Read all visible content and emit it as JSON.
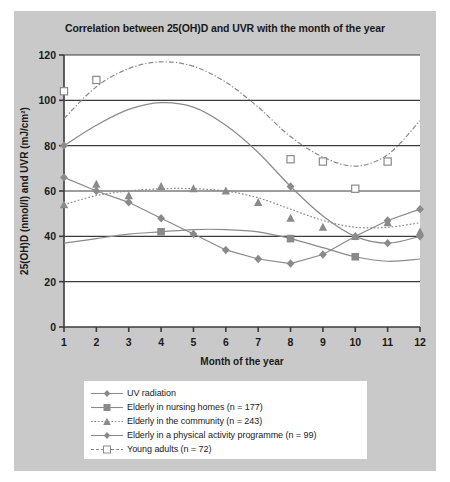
{
  "figure": {
    "title": "Correlation between 25(OH)D and UVR with the month of the year",
    "panel_color": "#c9c9c9",
    "plot_background": "#ffffff",
    "line_color": "#6e6e6e",
    "axis_color": "#3c3c3c"
  },
  "chart_data": {
    "type": "line",
    "title": "Correlation between 25(OH)D and UVR with the month of the year",
    "xlabel": "Month of the year",
    "ylabel": "25(OH)D (nmol/l) and UVR (mJ/cm²)",
    "x": [
      1,
      2,
      3,
      4,
      5,
      6,
      7,
      8,
      9,
      10,
      11,
      12
    ],
    "xticklabels": [
      "1",
      "2",
      "3",
      "4",
      "5",
      "6",
      "7",
      "8",
      "9",
      "10",
      "11",
      "12"
    ],
    "xlim": [
      1,
      12
    ],
    "ylim": [
      0,
      120
    ],
    "yticks": [
      0,
      20,
      40,
      60,
      80,
      100,
      120
    ],
    "yticklabels": [
      "0",
      "20",
      "40",
      "60",
      "80",
      "100",
      "120"
    ],
    "grid": "horizontal-gridlines-at-yticks",
    "legend_position": "below-plot",
    "series": [
      {
        "name": "UV radiation",
        "marker": "filled-diamond",
        "linestyle": "solid-smooth",
        "color": "#8a8a8a",
        "values": [
          80,
          89,
          96,
          99,
          97,
          89,
          77,
          62,
          49,
          40,
          37,
          40
        ],
        "markers_at": [
          1,
          8,
          11,
          12
        ],
        "marker_values": [
          80,
          62,
          37,
          40
        ]
      },
      {
        "name": "Elderly in nursing homes (n = 177)",
        "marker": "filled-square",
        "linestyle": "solid-smooth",
        "color": "#8a8a8a",
        "values": [
          37,
          39,
          41,
          42,
          43,
          43,
          42,
          39,
          35,
          31,
          29,
          30
        ],
        "markers_at": [
          4,
          8,
          10
        ],
        "marker_values": [
          42,
          39,
          31
        ]
      },
      {
        "name": "Elderly in the community (n = 243)",
        "marker": "filled-triangle",
        "linestyle": "dotted",
        "color": "#8a8a8a",
        "values": [
          54,
          58,
          60,
          61,
          61,
          60,
          57,
          52,
          47,
          44,
          44,
          46
        ],
        "markers_at": [
          1,
          2,
          3,
          4,
          5,
          6,
          7,
          8,
          9,
          10,
          11,
          12
        ],
        "marker_values": [
          54,
          63,
          58,
          62,
          61,
          60,
          55,
          48,
          44,
          40,
          46,
          42
        ]
      },
      {
        "name": "Elderly in a physical activity programme (n = 99)",
        "marker": "filled-diamond",
        "linestyle": "solid-straight",
        "color": "#8a8a8a",
        "values": [
          66,
          60,
          55,
          48,
          41,
          34,
          30,
          28,
          32,
          40,
          47,
          52
        ],
        "markers_at": [
          1,
          2,
          3,
          4,
          5,
          6,
          7,
          8,
          9,
          10,
          11,
          12
        ],
        "marker_values": [
          66,
          60,
          55,
          48,
          41,
          34,
          30,
          28,
          32,
          40,
          47,
          52
        ]
      },
      {
        "name": "Young adults (n = 72)",
        "marker": "open-square",
        "linestyle": "dash-dot",
        "color": "#8a8a8a",
        "values": [
          92,
          106,
          114,
          117,
          115,
          108,
          97,
          84,
          75,
          71,
          76,
          91
        ],
        "markers_at": [
          1,
          2,
          8,
          9,
          10,
          11
        ],
        "marker_values": [
          104,
          109,
          74,
          73,
          61,
          73
        ]
      }
    ]
  },
  "legend": {
    "items": [
      {
        "label": "UV radiation",
        "key": "filled-diamond-solid"
      },
      {
        "label": "Elderly in nursing homes (n = 177)",
        "key": "filled-square-solid"
      },
      {
        "label": "Elderly in the community (n = 243)",
        "key": "filled-triangle-dotted"
      },
      {
        "label": "Elderly in a physical activity programme (n = 99)",
        "key": "filled-diamond-solid"
      },
      {
        "label": "Young adults (n = 72)",
        "key": "open-square-dashed"
      }
    ]
  }
}
